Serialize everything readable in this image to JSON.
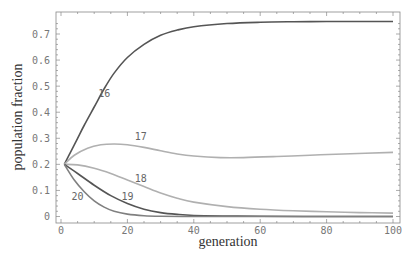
{
  "chart_data": {
    "type": "line",
    "title": "",
    "xlabel": "generation",
    "ylabel": "population fraction",
    "xlim": [
      0,
      100
    ],
    "ylim": [
      0,
      0.75
    ],
    "xticks": [
      0,
      20,
      40,
      60,
      80,
      100
    ],
    "xtick_labels": [
      "0",
      "20",
      "40",
      "60",
      "80",
      "100"
    ],
    "yticks": [
      0,
      0.1,
      0.2,
      0.3,
      0.4,
      0.5,
      0.6,
      0.7
    ],
    "ytick_labels": [
      "0",
      "0.1",
      "0.2",
      "0.3",
      "0.4",
      "0.5",
      "0.6",
      "0.7"
    ],
    "grid": false,
    "legend": "inline labels",
    "series": [
      {
        "name": "16",
        "color": "#555555",
        "label_pos": [
          13,
          0.46
        ],
        "x": [
          1,
          3,
          5,
          7,
          10,
          13,
          16,
          20,
          25,
          30,
          35,
          40,
          50,
          60,
          70,
          80,
          90,
          100
        ],
        "y": [
          0.2,
          0.25,
          0.3,
          0.35,
          0.42,
          0.49,
          0.55,
          0.61,
          0.66,
          0.695,
          0.715,
          0.728,
          0.74,
          0.745,
          0.747,
          0.748,
          0.748,
          0.748
        ]
      },
      {
        "name": "17",
        "color": "#b0b0b0",
        "label_pos": [
          24,
          0.293
        ],
        "x": [
          1,
          4,
          8,
          12,
          16,
          20,
          25,
          30,
          35,
          40,
          48,
          55,
          65,
          75,
          85,
          100
        ],
        "y": [
          0.2,
          0.235,
          0.262,
          0.275,
          0.278,
          0.275,
          0.265,
          0.252,
          0.24,
          0.232,
          0.226,
          0.226,
          0.23,
          0.235,
          0.24,
          0.246
        ]
      },
      {
        "name": "18",
        "color": "#b0b0b0",
        "label_pos": [
          24,
          0.132
        ],
        "x": [
          1,
          5,
          10,
          15,
          20,
          25,
          30,
          35,
          40,
          50,
          60,
          70,
          80,
          90,
          100
        ],
        "y": [
          0.2,
          0.198,
          0.185,
          0.165,
          0.14,
          0.115,
          0.09,
          0.07,
          0.055,
          0.038,
          0.028,
          0.022,
          0.018,
          0.015,
          0.013
        ]
      },
      {
        "name": "19",
        "color": "#555555",
        "label_pos": [
          20,
          0.062
        ],
        "x": [
          1,
          5,
          10,
          15,
          20,
          25,
          30,
          35,
          40,
          50,
          60,
          80,
          100
        ],
        "y": [
          0.2,
          0.165,
          0.12,
          0.08,
          0.05,
          0.028,
          0.015,
          0.008,
          0.004,
          0.002,
          0.001,
          0.0,
          0.0
        ]
      },
      {
        "name": "20",
        "color": "#808080",
        "label_pos": [
          5,
          0.062
        ],
        "x": [
          1,
          4,
          7,
          10,
          13,
          16,
          20,
          25,
          30,
          40,
          50,
          100
        ],
        "y": [
          0.2,
          0.14,
          0.095,
          0.06,
          0.036,
          0.02,
          0.009,
          0.003,
          0.001,
          0.0,
          0.0,
          0.0
        ]
      }
    ]
  }
}
